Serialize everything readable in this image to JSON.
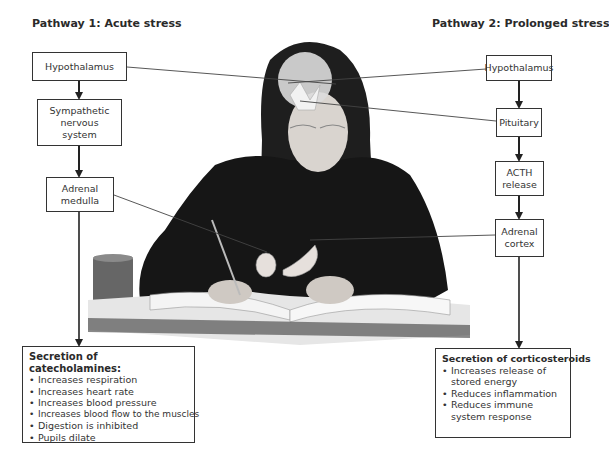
{
  "pathway1": {
    "title": "Pathway 1: Acute stress",
    "steps": [
      "Hypothalamus",
      "Sympathetic nervous system",
      "Adrenal medulla"
    ],
    "output": {
      "heading": "Secretion of catecholamines:",
      "effects": [
        "Increases respiration",
        "Increases heart rate",
        "Increases blood pressure",
        "Increases blood flow to the muscles",
        "Digestion is inhibited",
        "Pupils dilate"
      ]
    }
  },
  "pathway2": {
    "title": "Pathway 2: Prolonged stress",
    "steps": [
      "Hypothalamus",
      "Pituitary",
      "ACTH release",
      "Adrenal cortex"
    ],
    "output": {
      "heading": "Secretion of corticosteroids",
      "effects": [
        "Increases release of stored energy",
        "Reduces inflammation",
        "Reduces immune system response"
      ]
    }
  },
  "illustration": {
    "subject": "Student studying at desk with brain and adrenal glands highlighted"
  }
}
